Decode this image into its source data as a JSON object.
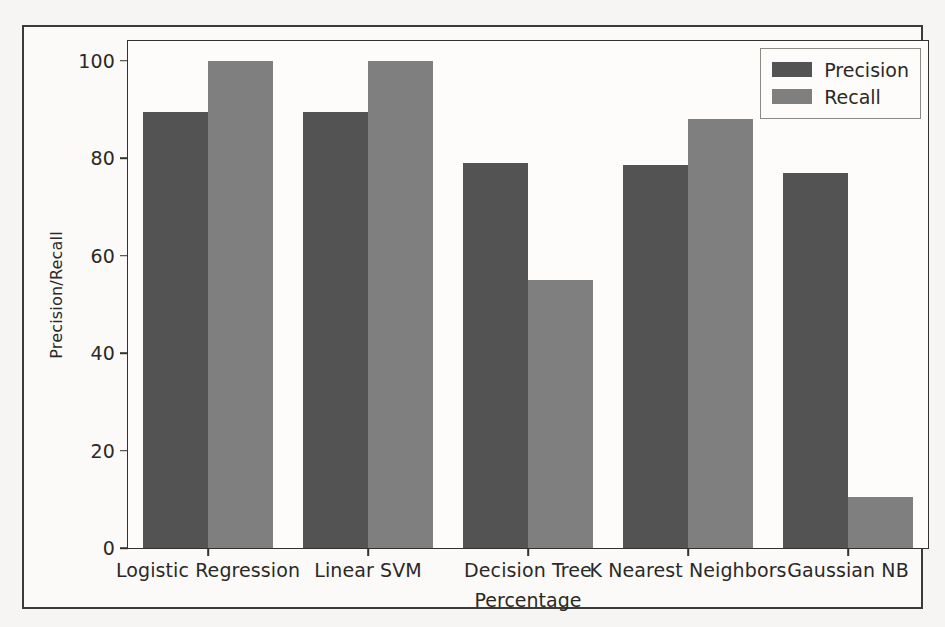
{
  "chart_data": {
    "type": "bar",
    "title": "",
    "xlabel": "Percentage",
    "ylabel": "Precision/Recall",
    "categories": [
      "Logistic Regression",
      "Linear SVM",
      "Decision Tree",
      "K Nearest Neighbors",
      "Gaussian NB"
    ],
    "series": [
      {
        "name": "Precision",
        "color": "#535353",
        "values": [
          89.5,
          89.5,
          79,
          78.5,
          77
        ]
      },
      {
        "name": "Recall",
        "color": "#7f7f7f",
        "values": [
          100,
          100,
          55,
          88,
          10.5
        ]
      }
    ],
    "ylim": [
      0,
      104
    ],
    "yticks": [
      0,
      20,
      40,
      60,
      80,
      100
    ],
    "ytick_labels": [
      "0",
      "20",
      "40",
      "60",
      "80",
      "100"
    ],
    "grid": false,
    "legend_position": "upper right",
    "legend_entries": [
      "Precision",
      "Recall"
    ]
  },
  "figure": {
    "background_color": "#fdfcfa",
    "axes_color": "#34322f",
    "text_color": "#2b2926"
  }
}
